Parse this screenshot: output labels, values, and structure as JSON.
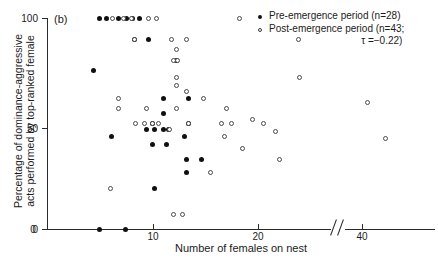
{
  "panel": {
    "label": "(b)"
  },
  "axes": {
    "xlabel": "Number of females on nest",
    "ylabel_line1": "Percentage of dominance-aggressive",
    "ylabel_line2": "acts performed by top-ranked female",
    "xticks": [
      "0",
      "10",
      "20",
      "40"
    ],
    "yticks": [
      "100",
      "50",
      "0"
    ],
    "x_break": true
  },
  "legend": {
    "pre_label": "Pre-emergence period (n=28)",
    "post_label": "Post-emergence period (n=43;",
    "stat_label": "τ =−0.22)"
  },
  "chart_data": {
    "type": "scatter",
    "title": "",
    "xlabel": "Number of females on nest",
    "ylabel": "Percentage of dominance-aggressive acts performed by top-ranked female",
    "xlim": [
      0,
      46
    ],
    "ylim": [
      0,
      100
    ],
    "xticks": [
      0,
      10,
      20,
      40
    ],
    "yticks": [
      0,
      50,
      100
    ],
    "x_axis_break": {
      "between": [
        22,
        36
      ]
    },
    "grid": false,
    "legend_position": "top-right",
    "annotations": [
      {
        "text": "(b)",
        "position": "top-left"
      },
      {
        "text": "τ =−0.22",
        "position": "legend"
      }
    ],
    "series": [
      {
        "name": "Pre-emergence period",
        "n": 28,
        "marker": "filled-circle",
        "color": "#101010",
        "points": [
          [
            5.0,
            100
          ],
          [
            5.6,
            100
          ],
          [
            6.8,
            100
          ],
          [
            7.5,
            100
          ],
          [
            8.1,
            100
          ],
          [
            8.8,
            100
          ],
          [
            8.3,
            90
          ],
          [
            9.6,
            90
          ],
          [
            4.4,
            75
          ],
          [
            12.3,
            80
          ],
          [
            11.0,
            62
          ],
          [
            13.4,
            62
          ],
          [
            11.0,
            55
          ],
          [
            10.0,
            50
          ],
          [
            13.4,
            50
          ],
          [
            9.4,
            47
          ],
          [
            10.2,
            47
          ],
          [
            11.0,
            47
          ],
          [
            11.5,
            47
          ],
          [
            6.1,
            44
          ],
          [
            13.0,
            44
          ],
          [
            10.0,
            40
          ],
          [
            11.3,
            40
          ],
          [
            13.2,
            33
          ],
          [
            14.6,
            33
          ],
          [
            13.2,
            27
          ],
          [
            10.2,
            19
          ],
          [
            5.0,
            0
          ],
          [
            7.4,
            0
          ]
        ]
      },
      {
        "name": "Post-emergence period",
        "n": 43,
        "tau": -0.22,
        "marker": "open-circle",
        "color": "#4a4a4a",
        "points": [
          [
            6.2,
            100
          ],
          [
            9.6,
            100
          ],
          [
            18.2,
            100
          ],
          [
            11.8,
            90
          ],
          [
            13.2,
            90
          ],
          [
            28.0,
            90
          ],
          [
            12.3,
            85
          ],
          [
            12.0,
            80
          ],
          [
            8.3,
            90
          ],
          [
            12.4,
            80
          ],
          [
            12.3,
            72
          ],
          [
            28.2,
            72
          ],
          [
            12.3,
            68
          ],
          [
            13.2,
            65
          ],
          [
            6.8,
            62
          ],
          [
            6.8,
            57
          ],
          [
            9.4,
            57
          ],
          [
            12.3,
            57
          ],
          [
            16.5,
            50
          ],
          [
            17.5,
            50
          ],
          [
            8.4,
            50
          ],
          [
            9.2,
            50
          ],
          [
            10.0,
            50
          ],
          [
            13.4,
            50
          ],
          [
            16.8,
            44
          ],
          [
            20.5,
            50
          ],
          [
            23.5,
            46
          ],
          [
            18.5,
            38
          ],
          [
            22.0,
            33
          ],
          [
            15.5,
            27
          ],
          [
            6.0,
            19
          ],
          [
            12.0,
            7
          ],
          [
            41.0,
            60
          ],
          [
            44.5,
            43
          ],
          [
            19.5,
            52
          ],
          [
            17.0,
            57
          ],
          [
            14.8,
            62
          ],
          [
            11.6,
            47
          ],
          [
            10.6,
            50
          ],
          [
            7.2,
            100
          ],
          [
            8.0,
            100
          ],
          [
            10.4,
            100
          ],
          [
            12.8,
            7
          ]
        ]
      }
    ]
  }
}
